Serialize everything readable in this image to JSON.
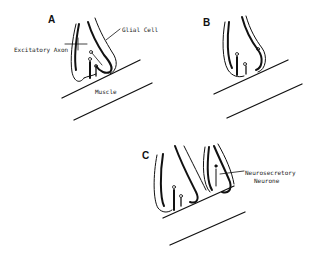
{
  "figure": {
    "panels": [
      {
        "id": "A",
        "label": "A"
      },
      {
        "id": "B",
        "label": "B"
      },
      {
        "id": "C",
        "label": "C"
      }
    ],
    "annotations": {
      "glial_cell": "Glial Cell",
      "excitatory_axon": "Excitatory Axon",
      "muscle": "Muscle",
      "neurosecretory_line1": "Neurosecretory",
      "neurosecretory_line2": "Neurone"
    }
  }
}
